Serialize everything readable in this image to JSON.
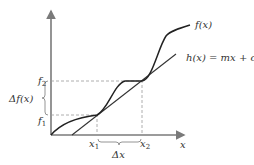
{
  "diagram": {
    "labels": {
      "f_of_x": "f(x)",
      "h_of_x": "h(x) = mx + c",
      "f2": "f",
      "f2_sub": "2",
      "f1": "f",
      "f1_sub": "1",
      "delta_f": "Δf(x)",
      "x1": "x",
      "x1_sub": "1",
      "x2": "x",
      "x2_sub": "2",
      "delta_x": "Δx",
      "x_axis": "x"
    },
    "colors": {
      "axis": "#7a7a7a",
      "curve": "#222222",
      "dashed_guides": "#9a9a9a"
    }
  }
}
